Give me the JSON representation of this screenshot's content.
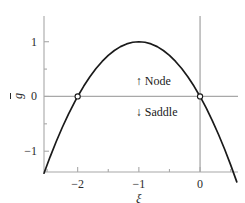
{
  "chart_data": {
    "type": "line",
    "title": "",
    "subtitle": "",
    "xlabel": "ξ",
    "ylabel": "ḡ",
    "xlim": [
      -2.55,
      0.62
    ],
    "ylim": [
      -1.38,
      1.47
    ],
    "grid": false,
    "legend_position": "none",
    "function": "ḡ = -ξ(ξ + 2)",
    "x_ticks": [
      {
        "value": -2,
        "label": "−2"
      },
      {
        "value": -1,
        "label": "−1"
      },
      {
        "value": 0,
        "label": "0"
      }
    ],
    "x_minor_ticks": [
      -2.5,
      -1.5,
      -0.5,
      0.5
    ],
    "y_ticks": [
      {
        "value": 1,
        "label": "1"
      },
      {
        "value": 0,
        "label": "0"
      },
      {
        "value": -1,
        "label": "−1"
      }
    ],
    "y_minor_ticks": [
      0.5,
      -0.5
    ],
    "series": [
      {
        "name": "ḡ = -ξ(ξ + 2)",
        "color": "#1a1a1a",
        "x": [
          -2.55,
          -2.45,
          -2.35,
          -2.25,
          -2.15,
          -2.05,
          -2.0,
          -1.9,
          -1.8,
          -1.7,
          -1.6,
          -1.5,
          -1.4,
          -1.3,
          -1.2,
          -1.1,
          -1.0,
          -0.9,
          -0.8,
          -0.7,
          -0.6,
          -0.5,
          -0.4,
          -0.3,
          -0.2,
          -0.1,
          0.0,
          0.1,
          0.2,
          0.3,
          0.4,
          0.5,
          0.6
        ],
        "y": [
          -1.4025,
          -1.1025,
          -0.8225,
          -0.5625,
          -0.3225,
          -0.1025,
          0.0,
          0.19,
          0.36,
          0.51,
          0.64,
          0.75,
          0.84,
          0.91,
          0.96,
          0.99,
          1.0,
          0.99,
          0.96,
          0.91,
          0.84,
          0.75,
          0.64,
          0.51,
          0.36,
          0.19,
          0.0,
          -0.21,
          -0.44,
          -0.69,
          -0.96,
          -1.25,
          -1.56
        ]
      }
    ],
    "markers": [
      {
        "name": "left-root",
        "x": -2,
        "y": 0,
        "style": "open-circle"
      },
      {
        "name": "right-root",
        "x": 0,
        "y": 0,
        "style": "open-circle"
      }
    ],
    "annotations": [
      {
        "name": "node",
        "arrow": "↑",
        "label": "Node",
        "x": -1.05,
        "y": 0.28
      },
      {
        "name": "saddle",
        "arrow": "↓",
        "label": "Saddle",
        "x": -1.05,
        "y": -0.28
      }
    ],
    "axis_lines": [
      {
        "name": "horizontal-zero-axis",
        "orientation": "horizontal",
        "value": 0,
        "color": "#a8a8a8"
      },
      {
        "name": "vertical-zero-axis",
        "orientation": "vertical",
        "value": 0,
        "color": "#a8a8a8"
      }
    ],
    "colors": {
      "curve": "#1a1a1a",
      "axis": "#a8a8a8",
      "tick_text": "#2b2b2b",
      "marker_edge": "#1a1a1a",
      "marker_fill": "#ffffff",
      "background": "#ffffff"
    }
  }
}
